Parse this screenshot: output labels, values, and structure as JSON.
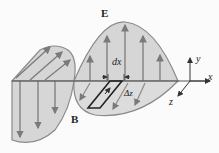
{
  "figure": {
    "labels": {
      "E": "E",
      "B": "B",
      "dx": "dx",
      "dz": "Δz",
      "axis_x": "x",
      "axis_y": "y",
      "axis_z": "z"
    },
    "colors": {
      "wave_fill": "#d6d6d6",
      "wave_edge": "#8a8a8a",
      "arrow": "#7a7a7a",
      "axis": "#333333",
      "background": "#fbfbfb"
    }
  }
}
